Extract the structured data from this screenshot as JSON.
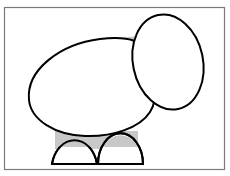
{
  "diagram": {
    "colors": {
      "background": "#ffffff",
      "frame": "#7a7a7a",
      "outline": "#000000",
      "shade": "#c8c8c8"
    },
    "shapes": [
      {
        "name": "body",
        "type": "egg-oval"
      },
      {
        "name": "head",
        "type": "tilted-oval"
      },
      {
        "name": "left-leg",
        "type": "semicircle"
      },
      {
        "name": "right-leg",
        "type": "semicircle"
      },
      {
        "name": "neck-shade",
        "type": "gray-triangle"
      },
      {
        "name": "legs-shade",
        "type": "gray-rectangle"
      }
    ]
  }
}
